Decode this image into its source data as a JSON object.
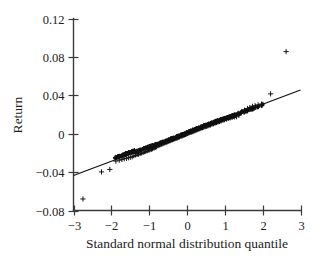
{
  "chart_data": {
    "type": "scatter",
    "title": "",
    "subtitle": "",
    "xlabel": "Standard normal distribution quantile",
    "ylabel": "Return",
    "xlim": [
      -3,
      3
    ],
    "ylim": [
      -0.08,
      0.12
    ],
    "grid": false,
    "legend": null,
    "xticks": [
      -3,
      -2,
      -1,
      0,
      1,
      2,
      3
    ],
    "xtick_labels": [
      "−3",
      "−2",
      "−1",
      "0",
      "1",
      "2",
      "3"
    ],
    "yticks": [
      -0.08,
      -0.04,
      0,
      0.04,
      0.08,
      0.12
    ],
    "ytick_labels": [
      "−0.08",
      "−0.04",
      "0",
      "0.04",
      "0.08",
      "0.12"
    ],
    "marker": "plus",
    "marker_color": "#151515",
    "reference_line": {
      "name": "theoretical quantile line",
      "x": [
        -3,
        3
      ],
      "y": [
        -0.0435,
        0.0455
      ],
      "slope": 0.01483,
      "intercept": 0.001,
      "color": "#101010"
    },
    "series": [
      {
        "name": "Sample quantiles of return",
        "points": [
          [
            -2.75,
            -0.068
          ],
          [
            -2.26,
            -0.0398
          ],
          [
            -2.04,
            -0.0372
          ],
          [
            -1.88,
            -0.0285
          ],
          [
            -1.79,
            -0.0276
          ],
          [
            -1.72,
            -0.0268
          ],
          [
            -1.66,
            -0.0261
          ],
          [
            -1.6,
            -0.0256
          ],
          [
            -1.55,
            -0.0251
          ],
          [
            -1.5,
            -0.0246
          ],
          [
            -1.45,
            -0.024
          ],
          [
            -1.41,
            -0.0234
          ],
          [
            -1.36,
            -0.0228
          ],
          [
            -1.32,
            -0.0223
          ],
          [
            -1.28,
            -0.0218
          ],
          [
            -1.24,
            -0.0212
          ],
          [
            -1.2,
            -0.0206
          ],
          [
            -1.16,
            -0.02
          ],
          [
            -1.12,
            -0.0194
          ],
          [
            -1.09,
            -0.0189
          ],
          [
            -1.05,
            -0.0184
          ],
          [
            -1.01,
            -0.0178
          ],
          [
            -0.98,
            -0.0173
          ],
          [
            -0.94,
            -0.0167
          ],
          [
            -0.91,
            -0.0161
          ],
          [
            -0.87,
            -0.0155
          ],
          [
            -0.84,
            -0.0148
          ],
          [
            -0.81,
            -0.014
          ],
          [
            -0.77,
            -0.0132
          ],
          [
            -0.74,
            -0.0126
          ],
          [
            -0.71,
            -0.012
          ],
          [
            -0.67,
            -0.0114
          ],
          [
            -0.64,
            -0.0109
          ],
          [
            -0.61,
            -0.0104
          ],
          [
            -0.58,
            -0.0099
          ],
          [
            -0.54,
            -0.0094
          ],
          [
            -0.51,
            -0.0089
          ],
          [
            -0.48,
            -0.0084
          ],
          [
            -0.45,
            -0.0079
          ],
          [
            -0.42,
            -0.0074
          ],
          [
            -0.38,
            -0.0069
          ],
          [
            -0.35,
            -0.0064
          ],
          [
            -0.32,
            -0.0059
          ],
          [
            -0.29,
            -0.0054
          ],
          [
            -0.26,
            -0.0049
          ],
          [
            -0.23,
            -0.0044
          ],
          [
            -0.2,
            -0.0039
          ],
          [
            -0.16,
            -0.0034
          ],
          [
            -0.13,
            -0.0029
          ],
          [
            -0.1,
            -0.0024
          ],
          [
            -0.07,
            -0.0019
          ],
          [
            -0.04,
            -0.0014
          ],
          [
            -0.01,
            -0.0009
          ],
          [
            0.02,
            -0.0004
          ],
          [
            0.05,
            0.0001
          ],
          [
            0.08,
            0.0006
          ],
          [
            0.11,
            0.0011
          ],
          [
            0.15,
            0.0016
          ],
          [
            0.18,
            0.0021
          ],
          [
            0.21,
            0.0026
          ],
          [
            0.24,
            0.0031
          ],
          [
            0.27,
            0.0036
          ],
          [
            0.31,
            0.0041
          ],
          [
            0.34,
            0.0046
          ],
          [
            0.37,
            0.0051
          ],
          [
            0.41,
            0.0056
          ],
          [
            0.44,
            0.0061
          ],
          [
            0.48,
            0.0066
          ],
          [
            0.51,
            0.0071
          ],
          [
            0.55,
            0.0076
          ],
          [
            0.58,
            0.0081
          ],
          [
            0.62,
            0.0086
          ],
          [
            0.66,
            0.0092
          ],
          [
            0.7,
            0.0098
          ],
          [
            0.74,
            0.0104
          ],
          [
            0.78,
            0.011
          ],
          [
            0.82,
            0.0116
          ],
          [
            0.86,
            0.0122
          ],
          [
            0.9,
            0.0128
          ],
          [
            0.95,
            0.0134
          ],
          [
            0.99,
            0.014
          ],
          [
            1.04,
            0.0146
          ],
          [
            1.09,
            0.0152
          ],
          [
            1.14,
            0.0158
          ],
          [
            1.19,
            0.0163
          ],
          [
            1.25,
            0.0168
          ],
          [
            1.31,
            0.0177
          ],
          [
            1.37,
            0.0192
          ],
          [
            1.44,
            0.0228
          ],
          [
            1.52,
            0.0245
          ],
          [
            1.6,
            0.0262
          ],
          [
            1.66,
            0.0272
          ],
          [
            1.73,
            0.0285
          ],
          [
            1.8,
            0.0292
          ],
          [
            1.88,
            0.03
          ],
          [
            1.97,
            0.0308
          ],
          [
            2.21,
            0.0415
          ],
          [
            2.62,
            0.0855
          ]
        ]
      }
    ],
    "annotations": [
      {
        "text": "lower tail outlier",
        "x": -2.75,
        "y": -0.068
      },
      {
        "text": "upper tail outlier",
        "x": 2.62,
        "y": 0.0855
      }
    ]
  },
  "axes": {
    "x_label": "Standard normal distribution quantile",
    "y_label": "Return"
  }
}
